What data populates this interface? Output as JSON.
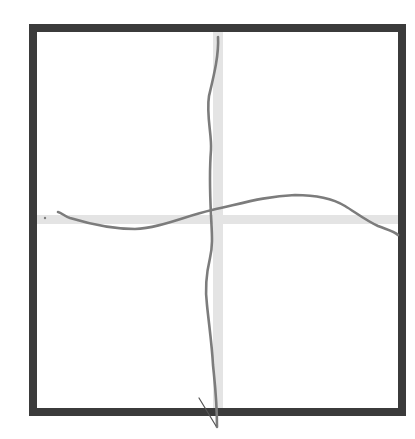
{
  "canvas": {
    "width": 415,
    "height": 439,
    "background": "#ffffff"
  },
  "colors": {
    "frame": "#3b3b3b",
    "guide": "#e4e4e4",
    "stroke": "#7c7c7c",
    "tick": "#555555"
  },
  "frame": {
    "x": 33,
    "y": 28,
    "width": 369,
    "height": 384,
    "thickness": 8
  },
  "guides": {
    "vertical": {
      "x": 213,
      "y": 32,
      "width": 10,
      "height": 376
    },
    "horizontal": {
      "x": 37,
      "y": 215,
      "width": 361,
      "height": 9
    }
  },
  "strokes": {
    "vertical_line": "M218,37 C219,55 214,75 209,96 C206,115 212,135 211,150 C209,175 210,195 211,215 C212,235 213,245 210,258 C206,275 205,290 207,305 C209,325 212,345 213,365 C215,385 217,400 217,427",
    "vertical_tick": "M199,398 L216,426",
    "horizontal_line": "M58,212 C62,213 64,216 70,218 C90,224 110,229 135,229 C160,228 185,216 212,210 C240,204 265,196 295,195 C320,195 335,200 345,206 C355,212 365,220 378,226 C388,230 394,231 398,235",
    "stray_dot": {
      "cx": 45,
      "cy": 218,
      "r": 1.2
    }
  }
}
